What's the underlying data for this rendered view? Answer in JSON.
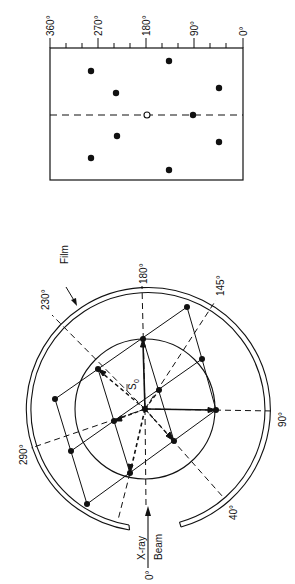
{
  "top_plot": {
    "axis_labels": [
      "360°",
      "270°",
      "180°",
      "90°",
      "0°"
    ],
    "axis_values": [
      360,
      270,
      180,
      90,
      0
    ],
    "points_filled": [
      {
        "x": 169,
        "y": 61
      },
      {
        "x": 91,
        "y": 71
      },
      {
        "x": 219,
        "y": 88
      },
      {
        "x": 116,
        "y": 93
      },
      {
        "x": 193,
        "y": 115
      },
      {
        "x": 117,
        "y": 136
      },
      {
        "x": 219,
        "y": 142
      },
      {
        "x": 91,
        "y": 158
      },
      {
        "x": 169,
        "y": 170
      }
    ],
    "point_open": {
      "x": 147,
      "y": 115
    }
  },
  "circle_diagram": {
    "labels": {
      "film": "Film",
      "a180": "180°",
      "a145": "145°",
      "a230": "230°",
      "a290": "290°",
      "a90": "90°",
      "a40": "40°",
      "a0": "0°",
      "xray": "X-ray",
      "beam": "Beam",
      "s0": "S",
      "s0_sub": "0"
    }
  }
}
